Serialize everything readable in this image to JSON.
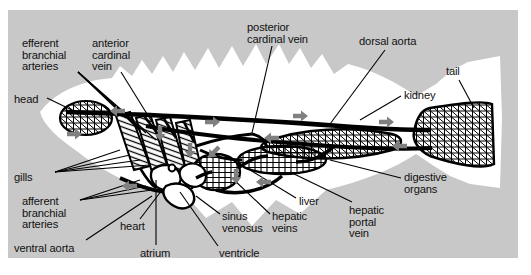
{
  "figure": {
    "panel_color": "#c8c8c8",
    "body_color": "#ffffff",
    "vessel_color": "#000000",
    "arrow_color": "#808080"
  },
  "labels": [
    {
      "id": "efferent-branchial-arteries",
      "text": "efferent\nbranchial\narteries",
      "x": 22,
      "y": 38,
      "align": "left"
    },
    {
      "id": "anterior-cardinal-vein",
      "text": "anterior\ncardinal\nvein",
      "x": 92,
      "y": 38,
      "align": "left"
    },
    {
      "id": "posterior-cardinal-vein",
      "text": "posterior\ncardinal vein",
      "x": 247,
      "y": 22,
      "align": "left"
    },
    {
      "id": "dorsal-aorta",
      "text": "dorsal aorta",
      "x": 359,
      "y": 36,
      "align": "left"
    },
    {
      "id": "tail",
      "text": "tail",
      "x": 446,
      "y": 66,
      "align": "left"
    },
    {
      "id": "head",
      "text": "head",
      "x": 14,
      "y": 94,
      "align": "left"
    },
    {
      "id": "kidney",
      "text": "kidney",
      "x": 404,
      "y": 90,
      "align": "left"
    },
    {
      "id": "gills",
      "text": "gills",
      "x": 14,
      "y": 172,
      "align": "left"
    },
    {
      "id": "digestive-organs",
      "text": "digestive\norgans",
      "x": 404,
      "y": 172,
      "align": "left"
    },
    {
      "id": "afferent-branchial-arteries",
      "text": "afferent\nbranchial\narteries",
      "x": 22,
      "y": 196,
      "align": "left"
    },
    {
      "id": "liver",
      "text": "liver",
      "x": 299,
      "y": 196,
      "align": "left"
    },
    {
      "id": "heart",
      "text": "heart",
      "x": 120,
      "y": 221,
      "align": "left"
    },
    {
      "id": "sinus-venosus",
      "text": "sinus\nvenosus",
      "x": 222,
      "y": 211,
      "align": "left"
    },
    {
      "id": "hepatic-veins",
      "text": "hepatic\nveins",
      "x": 272,
      "y": 211,
      "align": "left"
    },
    {
      "id": "hepatic-portal-vein",
      "text": "hepatic\nportal\nvein",
      "x": 349,
      "y": 205,
      "align": "left"
    },
    {
      "id": "ventral-aorta",
      "text": "ventral aorta",
      "x": 14,
      "y": 243,
      "align": "left"
    },
    {
      "id": "atrium",
      "text": "atrium",
      "x": 140,
      "y": 248,
      "align": "left"
    },
    {
      "id": "ventricle",
      "text": "ventricle",
      "x": 219,
      "y": 248,
      "align": "left"
    }
  ],
  "leaders": [
    {
      "id": "leader-efferent-1",
      "path": "M 78,72 L 126,118"
    },
    {
      "id": "leader-efferent-2",
      "path": "M 78,72 L 136,126"
    },
    {
      "id": "leader-efferent-3",
      "path": "M 78,72 L 146,133"
    },
    {
      "id": "leader-efferent-4",
      "path": "M 78,72 L 156,140"
    },
    {
      "id": "leader-anterior-cardinal",
      "path": "M 121,72 L 152,122"
    },
    {
      "id": "leader-posterior-cardinal",
      "path": "M 272,46 L 252,133"
    },
    {
      "id": "leader-dorsal-aorta",
      "path": "M 385,50 L 330,124"
    },
    {
      "id": "leader-tail",
      "path": "M 459,80 L 474,108"
    },
    {
      "id": "leader-head",
      "path": "M 47,98 L 76,112"
    },
    {
      "id": "leader-kidney",
      "path": "M 401,96 L 360,120"
    },
    {
      "id": "leader-gills-1",
      "path": "M 55,172 L 120,150"
    },
    {
      "id": "leader-gills-2",
      "path": "M 55,172 L 130,155"
    },
    {
      "id": "leader-gills-3",
      "path": "M 55,172 L 140,160"
    },
    {
      "id": "leader-gills-4",
      "path": "M 55,172 L 150,165"
    },
    {
      "id": "leader-digestive",
      "path": "M 401,178 L 330,160"
    },
    {
      "id": "leader-afferent-1",
      "path": "M 80,200 L 140,180"
    },
    {
      "id": "leader-afferent-2",
      "path": "M 80,200 L 146,186"
    },
    {
      "id": "leader-afferent-3",
      "path": "M 80,200 L 152,190"
    },
    {
      "id": "leader-liver",
      "path": "M 296,198 L 250,170"
    },
    {
      "id": "leader-heart",
      "path": "M 140,219 L 162,190"
    },
    {
      "id": "leader-sinus-venosus",
      "path": "M 220,214 L 196,196"
    },
    {
      "id": "leader-hepatic-veins",
      "path": "M 270,214 L 232,178"
    },
    {
      "id": "leader-hepatic-portal",
      "path": "M 352,202 L 290,172"
    },
    {
      "id": "leader-ventral-aorta",
      "path": "M 86,240 L 152,196"
    },
    {
      "id": "leader-atrium",
      "path": "M 156,245 L 156,180"
    },
    {
      "id": "leader-ventricle",
      "path": "M 218,246 L 180,192"
    }
  ],
  "flow_arrows": [
    {
      "id": "arrow-dorsal-head",
      "x": 118,
      "y": 111,
      "dir": "left"
    },
    {
      "id": "arrow-dorsal-mid",
      "x": 212,
      "y": 122,
      "dir": "right"
    },
    {
      "id": "arrow-dorsal-post",
      "x": 300,
      "y": 116,
      "dir": "right"
    },
    {
      "id": "arrow-dorsal-tail",
      "x": 386,
      "y": 122,
      "dir": "right"
    },
    {
      "id": "arrow-cardinal-back",
      "x": 272,
      "y": 138,
      "dir": "left"
    },
    {
      "id": "arrow-cardinal-tail",
      "x": 400,
      "y": 146,
      "dir": "left"
    },
    {
      "id": "arrow-head-down",
      "x": 74,
      "y": 134,
      "dir": "right"
    },
    {
      "id": "arrow-gill-down",
      "x": 160,
      "y": 133,
      "dir": "down"
    },
    {
      "id": "arrow-gill-down2",
      "x": 190,
      "y": 150,
      "dir": "down"
    },
    {
      "id": "arrow-heart-in",
      "x": 214,
      "y": 152,
      "dir": "downleft"
    },
    {
      "id": "arrow-ventral",
      "x": 130,
      "y": 186,
      "dir": "left"
    },
    {
      "id": "arrow-liver-in",
      "x": 236,
      "y": 176,
      "dir": "down"
    },
    {
      "id": "arrow-gut",
      "x": 264,
      "y": 182,
      "dir": "left"
    }
  ]
}
